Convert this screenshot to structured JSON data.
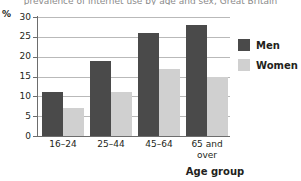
{
  "chart_data": {
    "type": "bar",
    "title": "prevalence of internet use by age and sex, Great Britain",
    "xlabel": "Age group",
    "ylabel": "%",
    "categories": [
      "16–24",
      "25–44",
      "45–64",
      "65 and over"
    ],
    "series": [
      {
        "name": "Men",
        "color": "#4a4a4a",
        "values": [
          11,
          19,
          26,
          28
        ]
      },
      {
        "name": "Women",
        "color": "#d0d0d0",
        "values": [
          7,
          11,
          17,
          15
        ]
      }
    ],
    "ylim": [
      0,
      30
    ],
    "ytick_step": 5,
    "yticks": [
      0,
      5,
      10,
      15,
      20,
      25,
      30
    ],
    "ytick_labels": [
      "0",
      "5",
      "10",
      "15",
      "20",
      "25",
      "30"
    ],
    "grid": "horizontal",
    "legend_position": "right"
  },
  "axis": {
    "unit_label": "%",
    "x_title": "Age group"
  },
  "legend": {
    "items": [
      {
        "label": "Men",
        "swatch": "men-swatch"
      },
      {
        "label": "Women",
        "swatch": "women-swatch"
      }
    ]
  },
  "xlabels": {
    "c0_line1": "16–24",
    "c0_line2": "",
    "c1_line1": "25–44",
    "c1_line2": "",
    "c2_line1": "45–64",
    "c2_line2": "",
    "c3_line1": "65 and",
    "c3_line2": "over"
  },
  "yticks": {
    "t0": "0",
    "t1": "5",
    "t2": "10",
    "t3": "15",
    "t4": "20",
    "t5": "25",
    "t6": "30"
  }
}
